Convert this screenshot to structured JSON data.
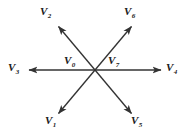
{
  "figure": {
    "name": "space-vector-diagram",
    "background_color": "#ffffff",
    "line_color": "#333333",
    "label_color": "#1a1a1a",
    "width": 185,
    "height": 139,
    "center": {
      "x": 95,
      "y": 70
    }
  },
  "vectors": [
    {
      "id": "v1",
      "symbol": "V",
      "subscript": "1",
      "label": "V1",
      "direction": "lower-left",
      "angle_deg": 240,
      "has_arrowhead": true,
      "line": {
        "x1": 95,
        "y1": 70,
        "x2": 57,
        "y2": 115
      },
      "label_pos": {
        "x": 45,
        "y": 115
      }
    },
    {
      "id": "v2",
      "symbol": "V",
      "subscript": "2",
      "label": "V2",
      "direction": "upper-left",
      "angle_deg": 120,
      "has_arrowhead": true,
      "line": {
        "x1": 95,
        "y1": 70,
        "x2": 57,
        "y2": 25
      },
      "label_pos": {
        "x": 40,
        "y": 6
      }
    },
    {
      "id": "v3",
      "symbol": "V",
      "subscript": "3",
      "label": "V3",
      "direction": "left",
      "angle_deg": 180,
      "has_arrowhead": true,
      "line": {
        "x1": 95,
        "y1": 70,
        "x2": 28,
        "y2": 70
      },
      "label_pos": {
        "x": 8,
        "y": 62
      }
    },
    {
      "id": "v4",
      "symbol": "V",
      "subscript": "4",
      "label": "V4",
      "direction": "right",
      "angle_deg": 0,
      "has_arrowhead": true,
      "line": {
        "x1": 95,
        "y1": 70,
        "x2": 162,
        "y2": 70
      },
      "label_pos": {
        "x": 166,
        "y": 62
      }
    },
    {
      "id": "v5",
      "symbol": "V",
      "subscript": "5",
      "label": "V5",
      "direction": "lower-right",
      "angle_deg": 300,
      "has_arrowhead": true,
      "line": {
        "x1": 95,
        "y1": 70,
        "x2": 133,
        "y2": 115
      },
      "label_pos": {
        "x": 131,
        "y": 115
      }
    },
    {
      "id": "v6",
      "symbol": "V",
      "subscript": "6",
      "label": "V6",
      "direction": "upper-right",
      "angle_deg": 60,
      "has_arrowhead": true,
      "line": {
        "x1": 95,
        "y1": 70,
        "x2": 133,
        "y2": 25
      },
      "label_pos": {
        "x": 124,
        "y": 6
      }
    }
  ],
  "zero_vectors": [
    {
      "id": "v0",
      "symbol": "V",
      "subscript": "0",
      "label": "V0",
      "label_pos": {
        "x": 64,
        "y": 55
      }
    },
    {
      "id": "v7",
      "symbol": "V",
      "subscript": "7",
      "label": "V7",
      "label_pos": {
        "x": 108,
        "y": 55
      }
    }
  ]
}
